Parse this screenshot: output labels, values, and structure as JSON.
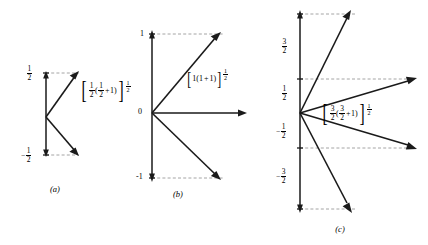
{
  "figure": {
    "type": "vector-diagram-set",
    "panels": [
      {
        "id": "a",
        "caption": "(a)",
        "quantum_number": "1/2",
        "vector_count": 2,
        "magnitude_label": {
          "open_bracket": "[",
          "coef_num": "1",
          "coef_den": "2",
          "paren_open": "(",
          "inner_num": "1",
          "inner_den": "2",
          "plus": "+",
          "one": "1",
          "paren_close": ")",
          "close_bracket": "]",
          "exp_num": "1",
          "exp_den": "2"
        },
        "axis_ticks": [
          {
            "value": "1/2",
            "sign": "",
            "num": "1",
            "den": "2"
          },
          {
            "value": "-1/2",
            "sign": "−",
            "num": "1",
            "den": "2"
          }
        ]
      },
      {
        "id": "b",
        "caption": "(b)",
        "quantum_number": "1",
        "vector_count": 3,
        "magnitude_label": {
          "open_bracket": "[",
          "coef": "1",
          "paren_open": "(",
          "inner": "1",
          "plus": "+",
          "one": "1",
          "paren_close": ")",
          "close_bracket": "]",
          "exp_num": "1",
          "exp_den": "2"
        },
        "axis_ticks": [
          {
            "value": "1"
          },
          {
            "value": "0"
          },
          {
            "value": "-1"
          }
        ]
      },
      {
        "id": "c",
        "caption": "(c)",
        "quantum_number": "3/2",
        "vector_count": 4,
        "magnitude_label": {
          "open_bracket": "[",
          "coef_num": "3",
          "coef_den": "2",
          "paren_open": "(",
          "inner_num": "3",
          "inner_den": "2",
          "plus": "+",
          "one": "1",
          "paren_close": ")",
          "close_bracket": "]",
          "exp_num": "1",
          "exp_den": "2"
        },
        "axis_ticks": [
          {
            "value": "3/2",
            "sign": "",
            "num": "3",
            "den": "2"
          },
          {
            "value": "1/2",
            "sign": "",
            "num": "1",
            "den": "2"
          },
          {
            "value": "-1/2",
            "sign": "−",
            "num": "1",
            "den": "2"
          },
          {
            "value": "-3/2",
            "sign": "−",
            "num": "3",
            "den": "2"
          }
        ]
      }
    ],
    "colors": {
      "ink": "#000000",
      "dashed": "#9a9a9a",
      "background": "#ffffff"
    }
  }
}
